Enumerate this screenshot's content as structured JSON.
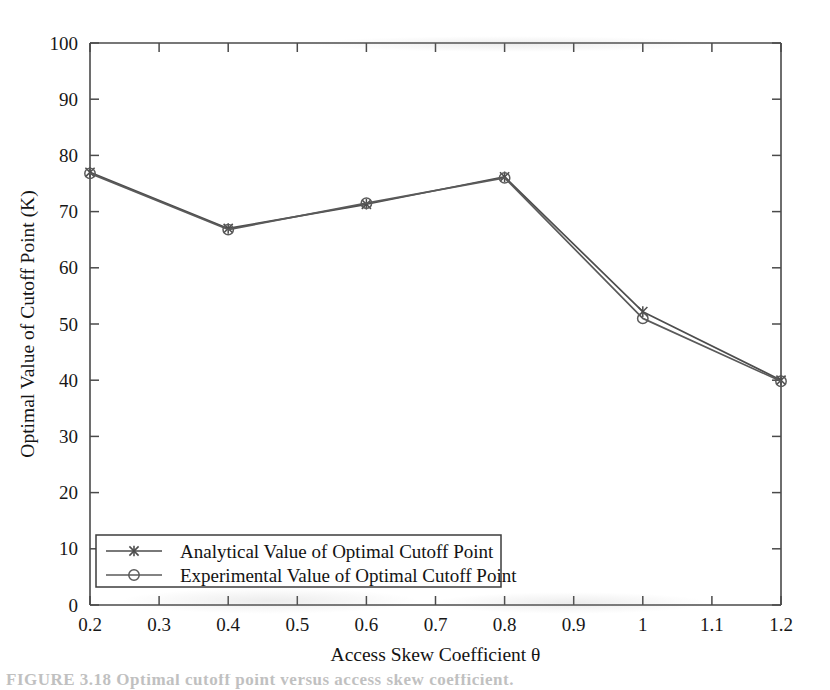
{
  "figure": {
    "caption": "FIGURE 3.18  Optimal cutoff point versus access skew coefficient."
  },
  "chart_data": {
    "type": "line",
    "title": "",
    "xlabel": "Access Skew Coefficient θ",
    "ylabel": "Optimal Value of Cutoff Point (K)",
    "x": [
      0.2,
      0.4,
      0.6,
      0.8,
      1.0,
      1.2
    ],
    "series": [
      {
        "name": "Analytical Value of Optimal Cutoff Point",
        "marker": "x",
        "color": "#4d4d4d",
        "values": [
          77.0,
          67.0,
          71.3,
          76.2,
          52.2,
          40.0
        ]
      },
      {
        "name": "Experimental Value of Optimal Cutoff Point",
        "marker": "circle",
        "color": "#5a5a5a",
        "values": [
          76.8,
          66.8,
          71.5,
          76.0,
          51.0,
          39.8
        ]
      }
    ],
    "xlim": [
      0.2,
      1.2
    ],
    "ylim": [
      0,
      100
    ],
    "xticks": [
      "0.2",
      "0.3",
      "0.4",
      "0.5",
      "0.6",
      "0.7",
      "0.8",
      "0.9",
      "1",
      "1.1",
      "1.2"
    ],
    "xtick_values": [
      0.2,
      0.3,
      0.4,
      0.5,
      0.6,
      0.7,
      0.8,
      0.9,
      1.0,
      1.1,
      1.2
    ],
    "yticks": [
      "0",
      "10",
      "20",
      "30",
      "40",
      "50",
      "60",
      "70",
      "80",
      "90",
      "100"
    ],
    "ytick_values": [
      0,
      10,
      20,
      30,
      40,
      50,
      60,
      70,
      80,
      90,
      100
    ],
    "grid": false,
    "legend_position": "lower-left",
    "legend_entries": [
      "Analytical Value of Optimal Cutoff Point",
      "Experimental Value of Optimal Cutoff Point"
    ]
  }
}
